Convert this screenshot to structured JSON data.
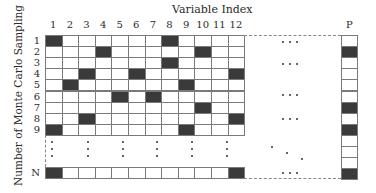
{
  "diagram": {
    "title": "Variable Index",
    "y_axis_label": "Number of Monte Carlo Sampling",
    "column_labels": [
      "1",
      "2",
      "3",
      "4",
      "5",
      "6",
      "7",
      "8",
      "9",
      "10",
      "11",
      "12"
    ],
    "row_labels": [
      "1",
      "2",
      "3",
      "4",
      "5",
      "6",
      "7",
      "8",
      "9"
    ],
    "last_row_label": "N",
    "extra_column_label": "P",
    "ellipsis": "• • •",
    "grid_rows": [
      {
        "row": "1",
        "filled_columns": [
          1,
          8
        ]
      },
      {
        "row": "2",
        "filled_columns": [
          4,
          10
        ]
      },
      {
        "row": "3",
        "filled_columns": [
          8
        ]
      },
      {
        "row": "4",
        "filled_columns": [
          3,
          6,
          12
        ]
      },
      {
        "row": "5",
        "filled_columns": [
          2,
          9
        ]
      },
      {
        "row": "6",
        "filled_columns": [
          5,
          7
        ]
      },
      {
        "row": "7",
        "filled_columns": [
          10
        ]
      },
      {
        "row": "8",
        "filled_columns": [
          3,
          12
        ]
      },
      {
        "row": "9",
        "filled_columns": [
          1,
          9
        ]
      },
      {
        "row": "N",
        "filled_columns": [
          1,
          12
        ]
      }
    ],
    "p_column_cells": 13,
    "p_column_filled": [
      2,
      7,
      9,
      13
    ],
    "colors": {
      "filled": "#3a3a3a",
      "empty": "#ffffff",
      "grid_line": "#7a7a7a",
      "dashed_line": "#888888"
    }
  }
}
